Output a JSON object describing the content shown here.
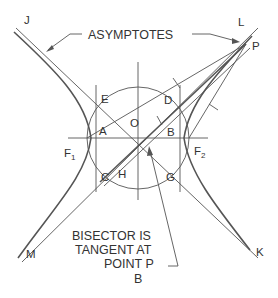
{
  "figure": {
    "callout_top": "ASYMPTOTES",
    "callout_bottom_lines": [
      "BISECTOR IS",
      "TANGENT AT",
      "POINT P"
    ],
    "figure_label": "B"
  },
  "points": {
    "J": "J",
    "L": "L",
    "M": "M",
    "K": "K",
    "P": "P",
    "E": "E",
    "D": "D",
    "O": "O",
    "A": "A",
    "B": "B",
    "C": "C",
    "G": "G",
    "H": "H",
    "F1": "F",
    "F1_sub": "1",
    "F2": "F",
    "F2_sub": "2"
  },
  "colors": {
    "ink": "#555555",
    "text": "#333333",
    "background": "#ffffff"
  }
}
